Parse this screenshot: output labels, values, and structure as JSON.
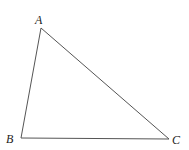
{
  "diagram": {
    "type": "triangle",
    "stroke_color": "#555555",
    "vertices": [
      {
        "label": "A",
        "x": 41,
        "y": 28,
        "label_x": 35,
        "label_y": 24
      },
      {
        "label": "B",
        "x": 21,
        "y": 138,
        "label_x": 6,
        "label_y": 143
      },
      {
        "label": "C",
        "x": 169,
        "y": 139,
        "label_x": 172,
        "label_y": 144
      }
    ]
  }
}
